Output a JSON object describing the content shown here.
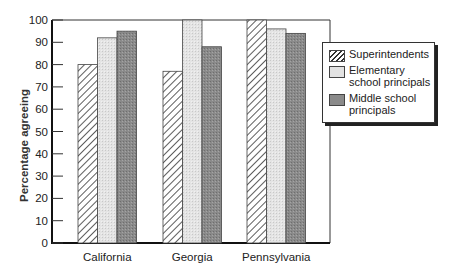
{
  "chart_data": {
    "type": "bar",
    "title": "",
    "xlabel": "",
    "ylabel": "Percentage agreeing",
    "ylim": [
      0,
      100
    ],
    "yticks": [
      0,
      10,
      20,
      30,
      40,
      50,
      60,
      70,
      80,
      90,
      100
    ],
    "categories": [
      "California",
      "Georgia",
      "Pennsylvania"
    ],
    "series": [
      {
        "name": "Superintendents",
        "pattern": "hatch",
        "color": "#ffffff",
        "values": [
          80,
          77,
          100
        ]
      },
      {
        "name": "Elementary school principals",
        "pattern": "light-stipple",
        "color": "#e2e2e2",
        "values": [
          92,
          100,
          96
        ]
      },
      {
        "name": "Middle school principals",
        "pattern": "dark-stipple",
        "color": "#8c8c8c",
        "values": [
          95,
          88,
          94
        ]
      }
    ],
    "legend": {
      "position": "right",
      "entries": [
        {
          "label_lines": [
            "Superintendents"
          ]
        },
        {
          "label_lines": [
            "Elementary",
            "school principals"
          ]
        },
        {
          "label_lines": [
            "Middle school",
            "principals"
          ]
        }
      ]
    },
    "grid": false
  }
}
